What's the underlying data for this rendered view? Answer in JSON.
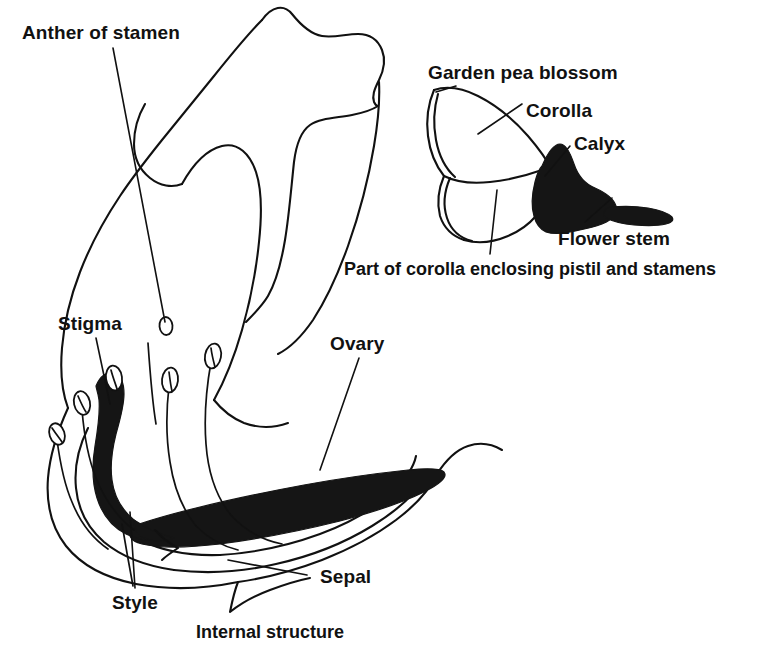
{
  "figure": {
    "background_color": "#ffffff",
    "ink_color": "#111111",
    "fill_color": "#151515",
    "width": 768,
    "height": 659
  },
  "labels": {
    "anther_of_stamen": "Anther of stamen",
    "stigma": "Stigma",
    "ovary": "Ovary",
    "style": "Style",
    "sepal": "Sepal",
    "internal_structure": "Internal structure",
    "garden_pea_blossom": "Garden pea blossom",
    "corolla": "Corolla",
    "calyx": "Calyx",
    "flower_stem": "Flower stem",
    "part_of_corolla": "Part of corolla enclosing pistil and stamens"
  },
  "panels": [
    {
      "name": "internal-structure",
      "caption": "Internal structure",
      "parts": [
        "Anther of stamen",
        "Stigma",
        "Style",
        "Ovary",
        "Sepal"
      ]
    },
    {
      "name": "garden-pea-blossom",
      "caption": "Garden pea blossom",
      "parts": [
        "Corolla",
        "Calyx",
        "Flower stem",
        "Part of corolla enclosing pistil and stamens"
      ]
    }
  ],
  "counts": {
    "anthers": 5
  }
}
